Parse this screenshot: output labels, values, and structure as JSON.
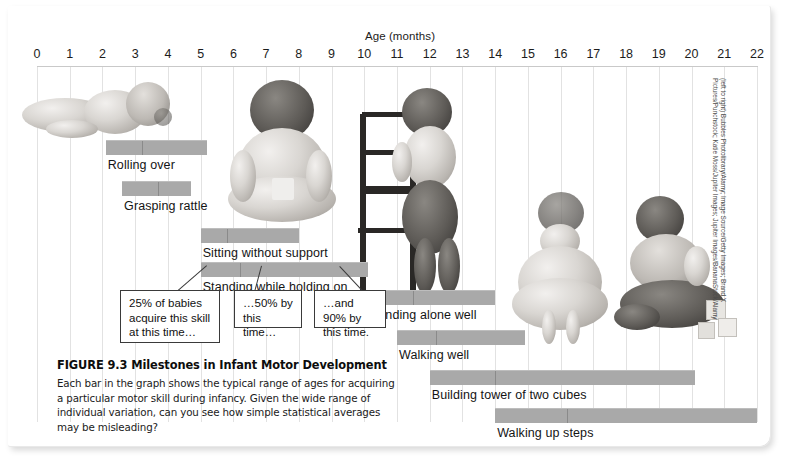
{
  "figure": {
    "caption_title": "FIGURE 9.3  Milestones in Infant Motor Development",
    "caption_body": "Each bar in the graph shows the typical range of ages for acquiring a particular motor skill during infancy. Given the wide range of individual variation, can you see how simple statistical averages may be misleading?",
    "credit": "(left to right) Bubbles Photolibrary/Alamy; Image Source/Getty Images; Brand X Pictures/Punchstock; Katie Moss/Jupiter Images; Jupiter Images/BananaStock/Alamy"
  },
  "callouts": [
    {
      "id": "callout-25",
      "text": "25% of babies acquire this skill at this time…"
    },
    {
      "id": "callout-50",
      "text": "…50% by this time…"
    },
    {
      "id": "callout-90",
      "text": "…and 90% by this time."
    }
  ],
  "chart_data": {
    "type": "bar",
    "orientation": "horizontal-range",
    "title": "Milestones in Infant Motor Development",
    "xlabel": "Age (months)",
    "ylabel": "",
    "xlim": [
      0,
      22
    ],
    "xticks": [
      0,
      1,
      2,
      3,
      4,
      5,
      6,
      7,
      8,
      9,
      10,
      11,
      12,
      13,
      14,
      15,
      16,
      17,
      18,
      19,
      20,
      21,
      22
    ],
    "grid": true,
    "legend": "none",
    "bar_color": "#a9a9a9",
    "marker_note": "divider line inside each bar marks the 50% acquisition age",
    "categories": [
      "Rolling over",
      "Grasping rattle",
      "Sitting without support",
      "Standing while holding on",
      "Standing alone well",
      "Walking well",
      "Building tower of two cubes",
      "Walking up steps"
    ],
    "bars": [
      {
        "label": "Rolling over",
        "start": 2.1,
        "median": 3.2,
        "end": 5.2
      },
      {
        "label": "Grasping rattle",
        "start": 2.6,
        "median": 3.7,
        "end": 4.7
      },
      {
        "label": "Sitting without support",
        "start": 5.0,
        "median": 5.8,
        "end": 8.0
      },
      {
        "label": "Standing while holding on",
        "start": 5.0,
        "median": 6.2,
        "end": 10.1
      },
      {
        "label": "Standing alone well",
        "start": 10.0,
        "median": 11.5,
        "end": 14.0
      },
      {
        "label": "Walking well",
        "start": 11.0,
        "median": 12.2,
        "end": 14.9
      },
      {
        "label": "Building tower of two cubes",
        "start": 12.0,
        "median": 14.0,
        "end": 20.1
      },
      {
        "label": "Walking up steps",
        "start": 14.0,
        "median": 16.2,
        "end": 22.0
      }
    ]
  },
  "photos": [
    {
      "name": "infant-rolling-over"
    },
    {
      "name": "infant-sitting"
    },
    {
      "name": "infant-standing-holding-chair"
    },
    {
      "name": "toddler-standing-alone"
    },
    {
      "name": "toddler-with-blocks"
    }
  ]
}
